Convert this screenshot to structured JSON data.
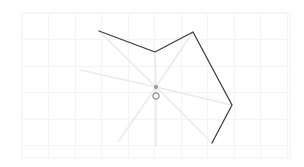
{
  "app": {
    "title": "Polygon Editor Canvas",
    "tool_name": "pen-tool"
  },
  "canvas": {
    "width": 304,
    "height": 167,
    "background_color": "#ffffff",
    "frame": {
      "x": 22,
      "y": 13,
      "width": 268,
      "height": 145
    },
    "frame_border_color": "#f2f2f3",
    "grid": {
      "visible": true,
      "spacing": 26.5,
      "color": "#f4f4f5",
      "origin_x": 22,
      "origin_y": 13
    }
  },
  "shape": {
    "name": "open-polyline",
    "stroke_color": "#3c3c3c",
    "stroke_width": 1.25,
    "fill": "none",
    "closed": false,
    "points": [
      {
        "label": "v1",
        "x": 99,
        "y": 31
      },
      {
        "label": "v2",
        "x": 155,
        "y": 52
      },
      {
        "label": "v3",
        "x": 193,
        "y": 32
      },
      {
        "label": "v4",
        "x": 232,
        "y": 105
      },
      {
        "label": "v5",
        "x": 212,
        "y": 143
      }
    ]
  },
  "guides": {
    "name": "radial-guides",
    "stroke_color": "#eaeaea",
    "stroke_width": 1.6,
    "origin": {
      "x": 156,
      "y": 87
    },
    "endpoints": [
      {
        "label": "g1",
        "x": 99,
        "y": 31
      },
      {
        "label": "g2",
        "x": 155,
        "y": 52
      },
      {
        "label": "g3",
        "x": 193,
        "y": 32
      },
      {
        "label": "g4",
        "x": 232,
        "y": 105
      },
      {
        "label": "g5",
        "x": 212,
        "y": 143
      },
      {
        "label": "g6",
        "x": 80,
        "y": 70
      },
      {
        "label": "g7",
        "x": 118,
        "y": 142
      },
      {
        "label": "g8",
        "x": 156,
        "y": 146
      }
    ]
  },
  "center_marker": {
    "name": "pivot-handle",
    "dot": {
      "x": 156,
      "y": 87,
      "r": 1.7,
      "color": "#9a9a9a"
    },
    "ring": {
      "x": 156,
      "y": 96,
      "r": 3.2,
      "color": "#6e6e6e"
    }
  }
}
